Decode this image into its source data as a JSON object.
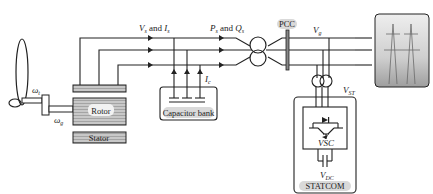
{
  "diagram": {
    "title": "",
    "components": {
      "turbine": {
        "omega_t": "ω",
        "omega_t_sub": "t",
        "omega_g": "ω",
        "omega_g_sub": "g"
      },
      "rotor": {
        "label": "Rotor"
      },
      "stator": {
        "label": "Stator"
      },
      "capacitor_bank": {
        "label": "Capacitor bank",
        "current": "I",
        "current_sub": "c"
      },
      "pcc": {
        "label": "PCC"
      },
      "statcom": {
        "label": "STATCOM",
        "vsc": "VSC",
        "vdc": "V",
        "vdc_sub": "DC",
        "vst": "V",
        "vst_sub": "ST"
      },
      "grid": {
        "label": "grid"
      }
    },
    "signals": {
      "vs_is": {
        "v": "V",
        "v_sub": "s",
        "and": " and ",
        "i": "I",
        "i_sub": "s"
      },
      "ps_qs": {
        "p": "P",
        "p_sub": "s",
        "and": " and ",
        "q": "Q",
        "q_sub": "s"
      },
      "vg": {
        "v": "V",
        "v_sub": "g"
      }
    }
  },
  "colors": {
    "line": "#222222",
    "fill_gray": "#bdbdbd",
    "label_bg": "#d9d9d9"
  }
}
